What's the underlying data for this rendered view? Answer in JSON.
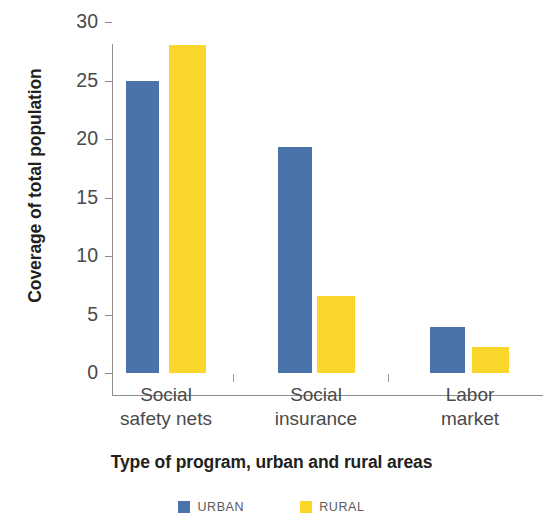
{
  "chart_data": {
    "type": "bar",
    "title": "",
    "xlabel": "Type of program, urban and rural areas",
    "ylabel": "Coverage of total population",
    "categories": [
      "Social safety nets",
      "Social insurance",
      "Labor market"
    ],
    "category_lines": [
      [
        "Social",
        "safety nets"
      ],
      [
        "Social",
        "insurance"
      ],
      [
        "Labor",
        "market"
      ]
    ],
    "series": [
      {
        "name": "URBAN",
        "color": "#4a73ab",
        "values": [
          25.0,
          19.3,
          3.9
        ]
      },
      {
        "name": "RURAL",
        "color": "#fbd72b",
        "values": [
          28.0,
          6.6,
          2.2
        ]
      }
    ],
    "ylim": [
      0,
      30
    ],
    "yticks": [
      0,
      5,
      10,
      15,
      20,
      25,
      30
    ],
    "ytick_labels": [
      "0",
      "5",
      "10",
      "15",
      "20",
      "25",
      "30"
    ],
    "grid": false,
    "legend_position": "bottom"
  },
  "axis": {
    "y_title": "Coverage of total population",
    "x_title": "Type of program, urban and rural areas",
    "tick_labels": [
      "30",
      "25",
      "20",
      "15",
      "10",
      "5",
      "0"
    ]
  },
  "legend": {
    "items": [
      {
        "label": "URBAN",
        "color": "#4a73ab"
      },
      {
        "label": "RURAL",
        "color": "#fbd72b"
      }
    ]
  }
}
